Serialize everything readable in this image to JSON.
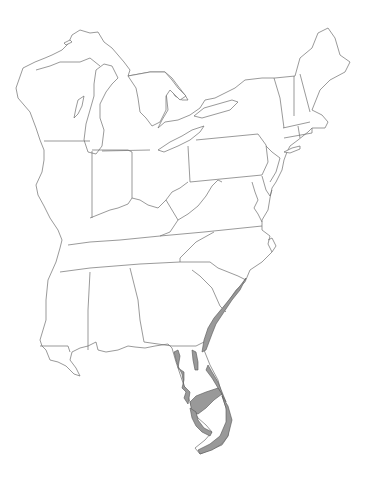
{
  "map": {
    "title": "",
    "region": "Eastern United States",
    "background": "#ffffff",
    "outline_color": "#6e6e6e",
    "range_fill_color": "#999999",
    "range_stroke_color": "#555555",
    "legend": [],
    "labels": []
  }
}
